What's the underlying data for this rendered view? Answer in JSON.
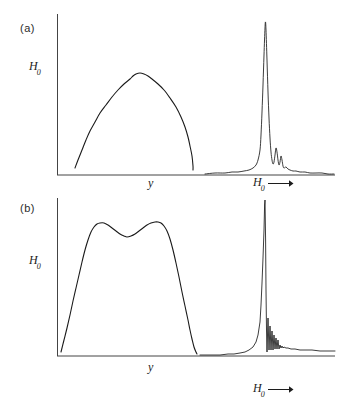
{
  "figure": {
    "background": "#ffffff",
    "line_color": "#1a1a1a",
    "panels": [
      {
        "id": "a",
        "label": "(a)",
        "y_axis_label": "H",
        "y_axis_label_sub": "0",
        "left_x_label": "y",
        "right_x_label": "H",
        "right_x_label_sub": "0",
        "right_x_arrow": "arrow-right-icon",
        "left_plot_description": "single smooth dome lineshape",
        "right_plot_description": "sharp single resonance peak with damped ringing tail"
      },
      {
        "id": "b",
        "label": "(b)",
        "y_axis_label": "H",
        "y_axis_label_sub": "0",
        "left_x_label": "y",
        "right_x_label": "H",
        "right_x_label_sub": "0",
        "right_x_arrow": "arrow-right-icon",
        "left_plot_description": "double-humped (camel-back) lineshape with central dip",
        "right_plot_description": "sharp edge resonance with strong damped oscillatory ringing"
      }
    ]
  },
  "chart_data": [
    {
      "type": "line",
      "panel": "a",
      "subplot": "left",
      "title": "",
      "xlabel": "y",
      "ylabel": "H0",
      "xlim": [
        57,
        335
      ],
      "ylim": [
        175,
        14
      ],
      "grid": false,
      "legend": null,
      "axis_frame": {
        "x_axis_y": 175,
        "y_axis_x": 57,
        "y_axis_top": 14
      },
      "points": [
        [
          75,
          168
        ],
        [
          78,
          160
        ],
        [
          82,
          150
        ],
        [
          86,
          140
        ],
        [
          90,
          131
        ],
        [
          95,
          122
        ],
        [
          100,
          113
        ],
        [
          106,
          105
        ],
        [
          112,
          97
        ],
        [
          118,
          90
        ],
        [
          124,
          84
        ],
        [
          130,
          79
        ],
        [
          133,
          76
        ],
        [
          136,
          74
        ],
        [
          140,
          73
        ],
        [
          144,
          74
        ],
        [
          148,
          76
        ],
        [
          152,
          79
        ],
        [
          158,
          84
        ],
        [
          164,
          90
        ],
        [
          170,
          98
        ],
        [
          176,
          107
        ],
        [
          181,
          117
        ],
        [
          185,
          127
        ],
        [
          188,
          137
        ],
        [
          190,
          146
        ],
        [
          192,
          156
        ],
        [
          193,
          166
        ],
        [
          193,
          170
        ]
      ]
    },
    {
      "type": "line",
      "panel": "a",
      "subplot": "right",
      "title": "",
      "xlabel": "H0",
      "ylabel": "",
      "xlim": [
        205,
        338
      ],
      "ylim": [
        175,
        14
      ],
      "grid": false,
      "legend": null,
      "baseline_y": 174,
      "peak_center_x": 265,
      "peak_height_y": 22,
      "points": [
        [
          205,
          174
        ],
        [
          215,
          173
        ],
        [
          225,
          173
        ],
        [
          232,
          172
        ],
        [
          238,
          172
        ],
        [
          244,
          171
        ],
        [
          249,
          170
        ],
        [
          253,
          168
        ],
        [
          256,
          165
        ],
        [
          258,
          160
        ],
        [
          260,
          150
        ],
        [
          261,
          135
        ],
        [
          262,
          112
        ],
        [
          263,
          85
        ],
        [
          264,
          55
        ],
        [
          265,
          28
        ],
        [
          265.5,
          22
        ],
        [
          266,
          30
        ],
        [
          267,
          60
        ],
        [
          268,
          92
        ],
        [
          269,
          118
        ],
        [
          270,
          138
        ],
        [
          271,
          152
        ],
        [
          272,
          160
        ],
        [
          273,
          164
        ],
        [
          274,
          162
        ],
        [
          275,
          155
        ],
        [
          276,
          148
        ],
        [
          277,
          152
        ],
        [
          278,
          160
        ],
        [
          279,
          165
        ],
        [
          280,
          162
        ],
        [
          281,
          156
        ],
        [
          282,
          160
        ],
        [
          283,
          166
        ],
        [
          284,
          168
        ],
        [
          286,
          167
        ],
        [
          288,
          169
        ],
        [
          290,
          170
        ],
        [
          293,
          171
        ],
        [
          296,
          171
        ],
        [
          300,
          172
        ],
        [
          305,
          172
        ],
        [
          310,
          173
        ],
        [
          316,
          173
        ],
        [
          322,
          173
        ],
        [
          328,
          174
        ],
        [
          334,
          174
        ]
      ]
    },
    {
      "type": "line",
      "panel": "b",
      "subplot": "left",
      "title": "",
      "xlabel": "y",
      "ylabel": "H0",
      "xlim": [
        57,
        335
      ],
      "ylim": [
        356,
        198
      ],
      "grid": false,
      "legend": null,
      "axis_frame": {
        "x_axis_y": 356,
        "y_axis_x": 57,
        "y_axis_top": 198
      },
      "points": [
        [
          61,
          352
        ],
        [
          64,
          340
        ],
        [
          67,
          328
        ],
        [
          70,
          315
        ],
        [
          73,
          301
        ],
        [
          76,
          288
        ],
        [
          79,
          275
        ],
        [
          82,
          262
        ],
        [
          85,
          250
        ],
        [
          88,
          240
        ],
        [
          91,
          232
        ],
        [
          94,
          227
        ],
        [
          97,
          224
        ],
        [
          100,
          223
        ],
        [
          104,
          223
        ],
        [
          108,
          225
        ],
        [
          112,
          228
        ],
        [
          116,
          231
        ],
        [
          120,
          234
        ],
        [
          124,
          236
        ],
        [
          127,
          237
        ],
        [
          131,
          236
        ],
        [
          135,
          234
        ],
        [
          139,
          231
        ],
        [
          143,
          228
        ],
        [
          147,
          225
        ],
        [
          151,
          223
        ],
        [
          155,
          222
        ],
        [
          158,
          222
        ],
        [
          161,
          223
        ],
        [
          164,
          226
        ],
        [
          167,
          231
        ],
        [
          170,
          239
        ],
        [
          173,
          250
        ],
        [
          176,
          263
        ],
        [
          179,
          277
        ],
        [
          182,
          292
        ],
        [
          185,
          306
        ],
        [
          188,
          320
        ],
        [
          190,
          330
        ],
        [
          192,
          339
        ],
        [
          194,
          347
        ],
        [
          196,
          352
        ],
        [
          197,
          354
        ]
      ]
    },
    {
      "type": "line",
      "panel": "b",
      "subplot": "right",
      "title": "",
      "xlabel": "H0",
      "ylabel": "",
      "xlim": [
        200,
        338
      ],
      "ylim": [
        356,
        198
      ],
      "grid": false,
      "legend": null,
      "baseline_y": 355,
      "edge_x": 265,
      "peak_height_y": 200,
      "points": [
        [
          200,
          355
        ],
        [
          210,
          355
        ],
        [
          220,
          355
        ],
        [
          228,
          354
        ],
        [
          234,
          354
        ],
        [
          240,
          353
        ],
        [
          245,
          352
        ],
        [
          249,
          350
        ],
        [
          253,
          347
        ],
        [
          256,
          342
        ],
        [
          258,
          335
        ],
        [
          260,
          322
        ],
        [
          261,
          305
        ],
        [
          262,
          283
        ],
        [
          263,
          258
        ],
        [
          264,
          230
        ],
        [
          264.6,
          205
        ],
        [
          265,
          200
        ],
        [
          265.6,
          240
        ],
        [
          266,
          290
        ],
        [
          266.5,
          330
        ],
        [
          267,
          352
        ],
        [
          267.5,
          335
        ],
        [
          268,
          318
        ],
        [
          268.5,
          335
        ],
        [
          269,
          350
        ],
        [
          269.5,
          338
        ],
        [
          270,
          326
        ],
        [
          270.5,
          338
        ],
        [
          271,
          350
        ],
        [
          271.5,
          340
        ],
        [
          272,
          331
        ],
        [
          272.5,
          340
        ],
        [
          273,
          350
        ],
        [
          273.5,
          342
        ],
        [
          274,
          335
        ],
        [
          274.5,
          342
        ],
        [
          275,
          349
        ],
        [
          275.5,
          343
        ],
        [
          276,
          338
        ],
        [
          276.5,
          344
        ],
        [
          277,
          349
        ],
        [
          277.5,
          344
        ],
        [
          278,
          340
        ],
        [
          278.5,
          345
        ],
        [
          279,
          349
        ],
        [
          280,
          345
        ],
        [
          281,
          348
        ],
        [
          282,
          346
        ],
        [
          283,
          348
        ],
        [
          284,
          347
        ],
        [
          286,
          348
        ],
        [
          288,
          348
        ],
        [
          291,
          349
        ],
        [
          295,
          349
        ],
        [
          300,
          350
        ],
        [
          306,
          350
        ],
        [
          312,
          350
        ],
        [
          320,
          351
        ],
        [
          328,
          351
        ],
        [
          335,
          351
        ]
      ]
    }
  ]
}
